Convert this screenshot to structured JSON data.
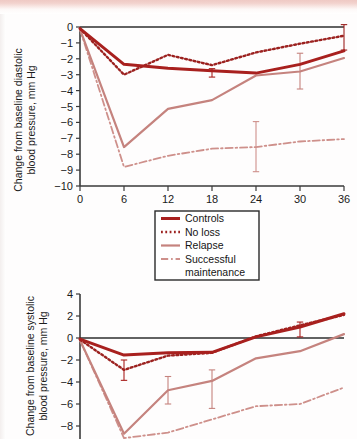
{
  "page": {
    "type": "scanned-figure-page",
    "background_band_color": "#efc9c4",
    "figure_count": 2
  },
  "colors": {
    "controls": "#A8201E",
    "no_loss": "#9C2220",
    "relapse": "#C5837E",
    "successful_maintenance": "#CE908B",
    "axis": "#3A3A3A",
    "text": "#1A1A1A"
  },
  "legend": {
    "name": "figure-legend",
    "items": [
      {
        "label": "Controls",
        "style": "solid",
        "color": "#A8201E",
        "width": 3.0
      },
      {
        "label": "No loss",
        "style": "dotted",
        "color": "#9C2220",
        "width": 2.4
      },
      {
        "label": "Relapse",
        "style": "solid",
        "color": "#C5837E",
        "width": 2.2
      },
      {
        "label": "Successful",
        "label2": "maintenance",
        "style": "dashdot",
        "color": "#CE908B",
        "width": 1.8
      }
    ]
  },
  "chart_data": [
    {
      "id": "diastolic",
      "type": "line",
      "title": "",
      "ylabel": "Change from baseline diastolic\nblood pressure, mm Hg",
      "ylabel_line1": "Change from baseline diastolic",
      "ylabel_line2": "blood pressure, mm Hg",
      "xlabel": "",
      "x": [
        0,
        6,
        12,
        18,
        24,
        30,
        36
      ],
      "xticks": [
        "0",
        "6",
        "12",
        "18",
        "24",
        "30",
        "36"
      ],
      "yticks": [
        "0",
        "−1",
        "−2",
        "−3",
        "−4",
        "−5",
        "−6",
        "−7",
        "−8",
        "−9",
        "−10"
      ],
      "ylim": [
        -10,
        0
      ],
      "xlim": [
        0,
        36
      ],
      "grid": false,
      "legend_position": "below-axes",
      "series": [
        {
          "name": "Controls",
          "color": "#A8201E",
          "style": "solid",
          "values": [
            -0.1,
            -2.35,
            -2.6,
            -2.75,
            -2.9,
            -2.35,
            -1.5
          ],
          "errorbars": [
            {
              "x": 18,
              "value": -2.9,
              "low": -3.15,
              "high": -2.62
            }
          ]
        },
        {
          "name": "No loss",
          "color": "#9C2220",
          "style": "dotted",
          "values": [
            -0.1,
            -3.0,
            -1.75,
            -2.4,
            -1.6,
            -1.05,
            -0.55
          ],
          "errorbars": [
            {
              "x": 36,
              "value": -0.55,
              "low": -1.45,
              "high": 0.15
            }
          ]
        },
        {
          "name": "Relapse",
          "color": "#C5837E",
          "style": "solid",
          "values": [
            -0.15,
            -7.55,
            -5.15,
            -4.6,
            -3.05,
            -2.8,
            -1.95
          ],
          "errorbars": [
            {
              "x": 30,
              "value": -2.8,
              "low": -3.9,
              "high": -1.65
            }
          ]
        },
        {
          "name": "Successful maintenance",
          "color": "#CE908B",
          "style": "dashdot",
          "values": [
            -0.15,
            -8.8,
            -8.1,
            -7.65,
            -7.55,
            -7.2,
            -7.05
          ],
          "errorbars": [
            {
              "x": 24,
              "value": -7.55,
              "low": -9.1,
              "high": -5.95
            }
          ]
        }
      ]
    },
    {
      "id": "systolic",
      "type": "line",
      "title": "",
      "ylabel_line1": "Change from baseline systolic",
      "ylabel_line2": "blood pressure, mm Hg",
      "xlabel": "",
      "x": [
        0,
        6,
        12,
        18,
        24,
        30,
        36
      ],
      "yticks": [
        "4",
        "2",
        "0",
        "−2",
        "−4",
        "−6",
        "−8"
      ],
      "ylim": [
        -9.5,
        4
      ],
      "xlim": [
        0,
        36
      ],
      "grid": false,
      "cropped_at_bottom": true,
      "series": [
        {
          "name": "Controls",
          "color": "#A8201E",
          "style": "solid",
          "values": [
            -0.1,
            -1.55,
            -1.35,
            -1.3,
            0.1,
            1.0,
            2.2
          ],
          "errorbars": [
            {
              "x": 6,
              "value": -2.9,
              "low": -3.85,
              "high": -2.0
            },
            {
              "x": 30,
              "value": 0.75,
              "low": 0.1,
              "high": 1.45
            }
          ]
        },
        {
          "name": "No loss",
          "color": "#9C2220",
          "style": "dotted",
          "values": [
            -0.15,
            -2.9,
            -1.6,
            -1.35,
            0.15,
            1.15,
            2.1
          ],
          "errorbars": []
        },
        {
          "name": "Relapse",
          "color": "#C5837E",
          "style": "solid",
          "values": [
            -0.2,
            -8.7,
            -4.75,
            -3.9,
            -1.85,
            -1.2,
            0.35
          ],
          "errorbars": [
            {
              "x": 12,
              "value": -4.75,
              "low": -6.0,
              "high": -3.5
            },
            {
              "x": 18,
              "value": -3.9,
              "low": -6.4,
              "high": -2.9
            }
          ]
        },
        {
          "name": "Successful maintenance",
          "color": "#CE908B",
          "style": "dashdot",
          "values": [
            -0.2,
            -9.1,
            -8.6,
            -7.4,
            -6.2,
            -6.0,
            -4.5
          ],
          "errorbars": []
        }
      ]
    }
  ]
}
